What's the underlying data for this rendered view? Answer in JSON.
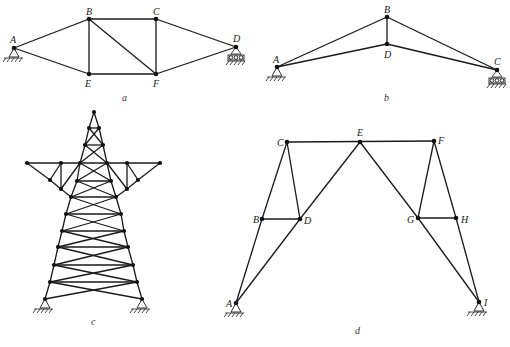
{
  "figures": [
    {
      "id": "a",
      "caption": "a",
      "nodes": {
        "A": [
          14,
          48
        ],
        "B": [
          89,
          19
        ],
        "C": [
          156,
          19
        ],
        "D": [
          236,
          47
        ],
        "E": [
          89,
          74
        ],
        "F": [
          156,
          74
        ]
      },
      "labels": {
        "A": "A",
        "B": "B",
        "C": "C",
        "D": "D",
        "E": "E",
        "F": "F"
      },
      "members": [
        [
          "A",
          "B"
        ],
        [
          "A",
          "E"
        ],
        [
          "B",
          "C"
        ],
        [
          "B",
          "E"
        ],
        [
          "B",
          "F"
        ],
        [
          "C",
          "F"
        ],
        [
          "E",
          "F"
        ],
        [
          "C",
          "D"
        ],
        [
          "F",
          "D"
        ]
      ],
      "supports": {
        "A": "pin",
        "D": "roller"
      }
    },
    {
      "id": "b",
      "caption": "b",
      "nodes": {
        "A": [
          277,
          67
        ],
        "B": [
          387,
          17
        ],
        "D": [
          387,
          44
        ],
        "C": [
          497,
          70
        ]
      },
      "labels": {
        "A": "A",
        "B": "B",
        "C": "C",
        "D": "D"
      },
      "members": [
        [
          "A",
          "B"
        ],
        [
          "B",
          "C"
        ],
        [
          "B",
          "D"
        ],
        [
          "A",
          "D"
        ],
        [
          "D",
          "C"
        ]
      ],
      "supports": {
        "A": "pin",
        "C": "roller"
      }
    },
    {
      "id": "c",
      "caption": "c",
      "description": "Transmission tower truss with cross-bracing and two cantilever crossarms",
      "supports": "two pinned supports at base"
    },
    {
      "id": "d",
      "caption": "d",
      "nodes": {
        "A": [
          236,
          303
        ],
        "B": [
          262,
          219
        ],
        "C": [
          287,
          142
        ],
        "D": [
          300,
          219
        ],
        "E": [
          360,
          142
        ],
        "F": [
          434,
          141
        ],
        "G": [
          418,
          218
        ],
        "H": [
          456,
          218
        ],
        "I": [
          479,
          302
        ]
      },
      "labels": {
        "A": "A",
        "B": "B",
        "C": "C",
        "D": "D",
        "E": "E",
        "F": "F",
        "G": "G",
        "H": "H",
        "I": "I"
      },
      "members": [
        [
          "A",
          "B"
        ],
        [
          "B",
          "C"
        ],
        [
          "C",
          "D"
        ],
        [
          "B",
          "D"
        ],
        [
          "A",
          "D"
        ],
        [
          "D",
          "E"
        ],
        [
          "C",
          "E"
        ],
        [
          "E",
          "F"
        ],
        [
          "E",
          "G"
        ],
        [
          "G",
          "I"
        ],
        [
          "F",
          "G"
        ],
        [
          "G",
          "H"
        ],
        [
          "F",
          "H"
        ],
        [
          "H",
          "I"
        ]
      ],
      "supports": {
        "A": "pin",
        "I": "pin"
      }
    }
  ],
  "captions": {
    "a": "a",
    "b": "b",
    "c": "c",
    "d": "d"
  },
  "node_labels": {
    "a": {
      "A": "A",
      "B": "B",
      "C": "C",
      "D": "D",
      "E": "E",
      "F": "F"
    },
    "b": {
      "A": "A",
      "B": "B",
      "C": "C",
      "D": "D"
    },
    "d": {
      "A": "A",
      "B": "B",
      "C": "C",
      "D": "D",
      "E": "E",
      "F": "F",
      "G": "G",
      "H": "H",
      "I": "I"
    }
  }
}
